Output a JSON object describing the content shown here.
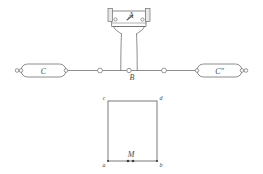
{
  "figure": {
    "title": "",
    "background_color": "#ffffff",
    "ink_color": "#6e6e6e",
    "label_color": "#4a4a4a"
  },
  "upper_diagram": {
    "name": "apparatus-schematic",
    "device_label": "A",
    "junction_label": "B",
    "left_capsule_label": "C",
    "right_capsule_label": "Cʺ",
    "terminals": [
      "left-end-terminal",
      "left-capsule-left-node",
      "left-capsule-right-node",
      "left-line-node",
      "junction-node-b",
      "right-line-node",
      "right-capsule-left-node",
      "right-capsule-right-node",
      "right-end-terminal"
    ],
    "device_parts": [
      "left-flange",
      "right-flange",
      "case-body",
      "pointer-needle",
      "left-post",
      "right-post",
      "neck-funnel",
      "left-leg",
      "right-leg"
    ]
  },
  "lower_diagram": {
    "name": "rectangle-diagram",
    "corner_top_left": "c",
    "corner_top_right": "d",
    "corner_bottom_left": "a",
    "corner_bottom_right": "b",
    "point_label": "M",
    "points": [
      "point-m-left-dot",
      "point-m-right-dot"
    ]
  }
}
